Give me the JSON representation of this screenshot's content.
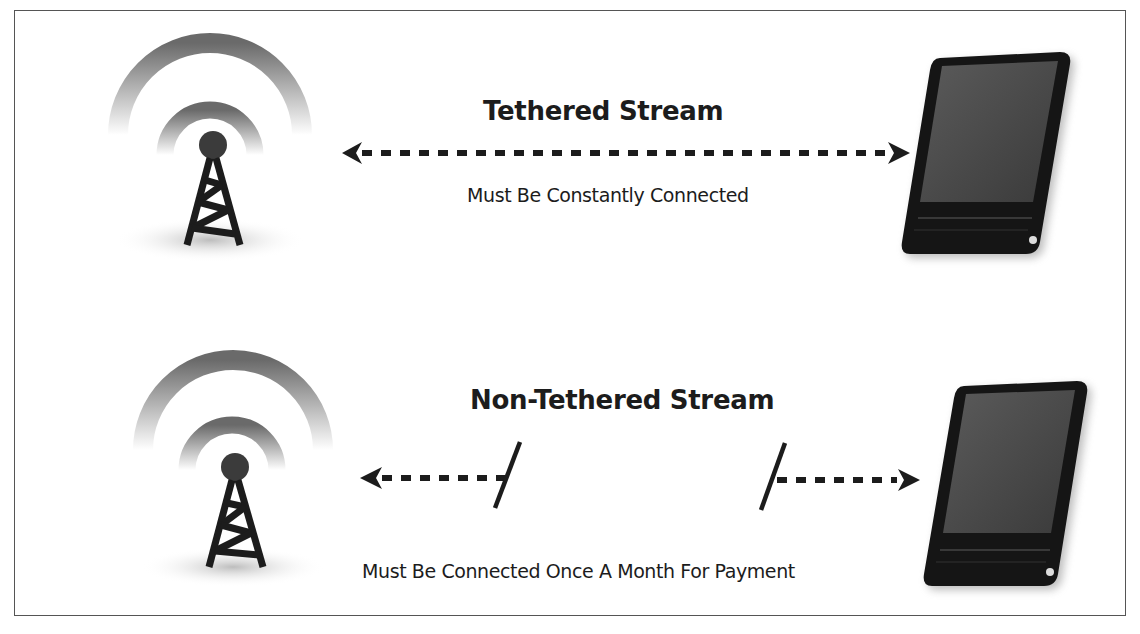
{
  "diagram": {
    "tethered": {
      "title": "Tethered Stream",
      "caption": "Must Be Constantly Connected",
      "connection": "bidirectional-dashed-arrow"
    },
    "non_tethered": {
      "title": "Non-Tethered Stream",
      "caption": "Must Be Connected Once A Month For Payment",
      "connection": "broken-dashed-arrows"
    },
    "icons": {
      "source": "cell-tower-icon",
      "device": "smartphone-icon"
    },
    "colors": {
      "ink": "#1c1c1c",
      "signal_wave": "#6e6e6e",
      "border": "#555555",
      "background": "#ffffff"
    }
  }
}
